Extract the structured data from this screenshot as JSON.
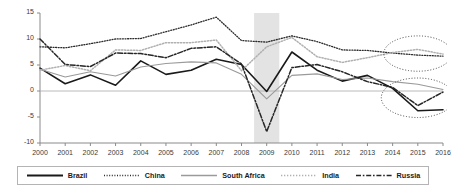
{
  "chart_data": {
    "type": "line",
    "title": "",
    "xlabel": "",
    "ylabel": "",
    "x": [
      2000,
      2001,
      2002,
      2003,
      2004,
      2005,
      2006,
      2007,
      2008,
      2009,
      2010,
      2011,
      2012,
      2013,
      2014,
      2015,
      2016
    ],
    "ylim": [
      -10,
      15
    ],
    "yticks": [
      15,
      10,
      5,
      0,
      -5,
      -10
    ],
    "xticks": [
      "2000",
      "2001",
      "2002",
      "2003",
      "2004",
      "2005",
      "2006",
      "2007",
      "2008",
      "2009",
      "2010",
      "2011",
      "2012",
      "2013",
      "2014",
      "2015",
      "2016"
    ],
    "grid": false,
    "zero_line": true,
    "legend_position": "bottom",
    "highlight_band": {
      "from": 2008.5,
      "to": 2009.5,
      "color": "#e3e3e3",
      "label": ""
    },
    "annotations": [
      {
        "name": "ellipse-india-china-2014-2016",
        "type": "ellipse",
        "x_center": 2015.0,
        "y_center": 7.2,
        "x_radius": 1.35,
        "y_radius": 3.4
      },
      {
        "name": "ellipse-brazil-russia-2014-2016",
        "type": "ellipse",
        "x_center": 2015.0,
        "y_center": -1.3,
        "x_radius": 1.45,
        "y_radius": 3.8
      }
    ],
    "series": [
      {
        "name": "Brazil",
        "color": "#1a1a1a",
        "style": "solid",
        "width": 1.6,
        "values": [
          4.4,
          1.4,
          3.1,
          1.1,
          5.8,
          3.2,
          4.0,
          6.1,
          5.1,
          -0.1,
          7.5,
          4.0,
          1.9,
          3.0,
          0.5,
          -3.8,
          -3.6
        ]
      },
      {
        "name": "China",
        "color": "#2b2b2b",
        "style": "dotted",
        "width": 1.3,
        "values": [
          8.5,
          8.3,
          9.1,
          10.0,
          10.1,
          11.4,
          12.7,
          14.2,
          9.7,
          9.4,
          10.6,
          9.5,
          7.9,
          7.8,
          7.3,
          6.9,
          6.7
        ]
      },
      {
        "name": "South Africa",
        "color": "#9a9a9a",
        "style": "solid",
        "width": 1.1,
        "values": [
          4.2,
          2.7,
          3.7,
          2.9,
          4.6,
          5.3,
          5.6,
          5.4,
          3.2,
          -1.5,
          3.0,
          3.3,
          2.2,
          2.5,
          1.8,
          1.3,
          0.3
        ]
      },
      {
        "name": "India",
        "color": "#b0b0b0",
        "style": "dotted",
        "width": 1.5,
        "values": [
          4.0,
          4.9,
          3.9,
          7.9,
          7.8,
          9.3,
          9.3,
          9.8,
          3.9,
          8.5,
          10.3,
          6.6,
          5.5,
          6.4,
          7.4,
          8.0,
          7.1
        ]
      },
      {
        "name": "Russia",
        "color": "#262626",
        "style": "dashdot",
        "width": 1.5,
        "values": [
          10.0,
          5.1,
          4.7,
          7.3,
          7.2,
          6.4,
          8.2,
          8.5,
          5.2,
          -7.8,
          4.5,
          5.1,
          3.7,
          1.8,
          0.7,
          -2.8,
          -0.2
        ]
      }
    ]
  },
  "axis": {
    "y_tick_labels": [
      "15",
      "10",
      "5",
      "0",
      "-5",
      "-10"
    ],
    "x_tick_labels": [
      "2000",
      "2001",
      "2002",
      "2003",
      "2004",
      "2005",
      "2006",
      "2007",
      "2008",
      "2009",
      "2010",
      "2011",
      "2012",
      "2013",
      "2014",
      "2015",
      "2016"
    ]
  },
  "legend": {
    "items": [
      {
        "label": "Brazil",
        "key": "solid-dark-line-key"
      },
      {
        "label": "China",
        "key": "dotted-dark-line-key"
      },
      {
        "label": "South Africa",
        "key": "solid-gray-line-key"
      },
      {
        "label": "India",
        "key": "dotted-gray-line-key"
      },
      {
        "label": "Russia",
        "key": "dashdot-dark-line-key"
      }
    ]
  }
}
